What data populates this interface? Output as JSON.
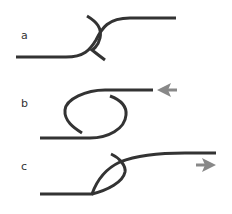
{
  "panels": [
    {
      "id": "a",
      "label": "a",
      "description": "strand crossing forming an S-overlap"
    },
    {
      "id": "b",
      "label": "b",
      "description": "open loop with arrow pointing left",
      "arrow_direction": "left"
    },
    {
      "id": "c",
      "label": "c",
      "description": "crossed loop with arrow pointing right",
      "arrow_direction": "right"
    }
  ],
  "colors": {
    "strand": "#333333",
    "arrow": "#888888",
    "label": "#333333",
    "background": "#ffffff"
  }
}
